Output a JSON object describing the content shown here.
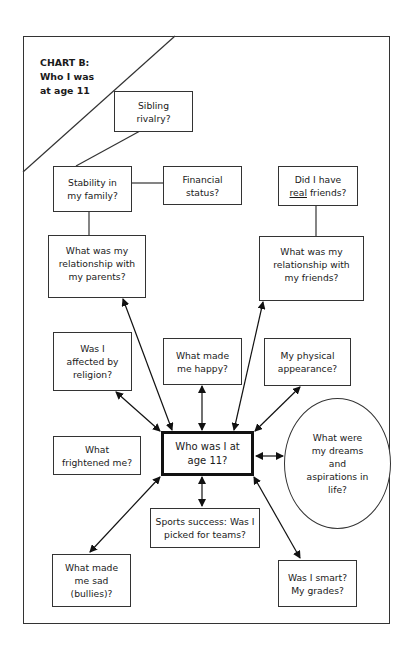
{
  "chart_title": {
    "label": "CHART B:",
    "subtitle": "Who I was\nat age 11"
  },
  "nodes": {
    "center": "Who was I at\nage 11?",
    "sibling": "Sibling\nrivalry?",
    "stability": "Stability in\nmy family?",
    "financial": "Financial\nstatus?",
    "real_friends_prefix": "Did I have",
    "real_friends_underlined": "real",
    "real_friends_suffix": " friends?",
    "parents": "What was my\nrelationship with\nmy parents?",
    "friends": "What was my\nrelationship with\nmy friends?",
    "religion": "Was I\naffected by\nreligion?",
    "happy": "What made\nme happy?",
    "physical": "My physical\nappearance?",
    "frightened": "What\nfrightened me?",
    "dreams": "What were\nmy dreams\nand\naspirations in\nlife?",
    "sports": "Sports success: Was I\npicked for teams?",
    "sad": "What made\nme sad\n(bullies)?",
    "smart": "Was I smart?\nMy grades?"
  },
  "colors": {
    "line": "#333333",
    "center_border": "#111111",
    "background": "#ffffff"
  }
}
